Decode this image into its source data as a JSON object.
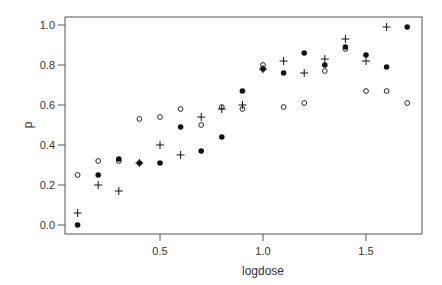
{
  "chart_data": {
    "type": "scatter",
    "title": "",
    "xlabel": "logdose",
    "ylabel": "p",
    "xlim": [
      0.05,
      1.75
    ],
    "ylim": [
      -0.03,
      1.05
    ],
    "x_ticks": [
      0.5,
      1.0,
      1.5
    ],
    "x_tick_labels": [
      "0.5",
      "1.0",
      "1.5"
    ],
    "y_ticks": [
      0.0,
      0.2,
      0.4,
      0.6,
      0.8,
      1.0
    ],
    "y_tick_labels": [
      "0.0",
      "0.2",
      "0.4",
      "0.6",
      "0.8",
      "1.0"
    ],
    "grid": false,
    "legend": null,
    "x": [
      0.1,
      0.2,
      0.3,
      0.4,
      0.5,
      0.6,
      0.7,
      0.8,
      0.9,
      1.0,
      1.1,
      1.2,
      1.3,
      1.4,
      1.5,
      1.6,
      1.7
    ],
    "series": [
      {
        "name": "filled-circle",
        "marker": "filled-circle",
        "values": [
          0.0,
          0.25,
          0.33,
          0.31,
          0.31,
          0.49,
          0.37,
          0.44,
          0.67,
          0.78,
          0.76,
          0.86,
          0.8,
          0.89,
          0.85,
          0.79,
          0.99
        ]
      },
      {
        "name": "open-circle",
        "marker": "open-circle",
        "values": [
          0.25,
          0.32,
          0.32,
          0.53,
          0.54,
          0.58,
          0.5,
          0.59,
          0.58,
          0.8,
          0.59,
          0.61,
          0.77,
          0.88,
          0.67,
          0.67,
          0.61
        ]
      },
      {
        "name": "plus",
        "marker": "plus",
        "values": [
          0.06,
          0.2,
          0.17,
          0.31,
          0.4,
          0.35,
          0.54,
          0.58,
          0.6,
          0.78,
          0.82,
          0.76,
          0.83,
          0.93,
          0.82,
          0.99,
          null
        ]
      }
    ]
  },
  "colors": {
    "frame": "#555555",
    "marker": "#111111",
    "text": "#333333"
  }
}
